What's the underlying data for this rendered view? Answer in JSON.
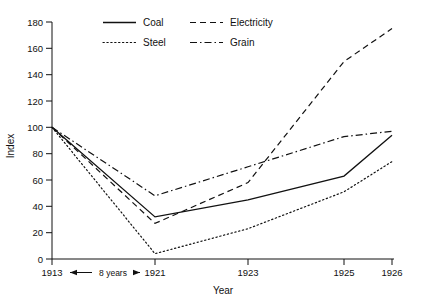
{
  "chart_data": {
    "type": "line",
    "title": "",
    "xlabel": "Year",
    "ylabel": "Index",
    "x": [
      "1913",
      "1921",
      "1923",
      "1925",
      "1926"
    ],
    "xtick_labels": [
      "1913",
      "1921",
      "1923",
      "1925",
      "1926"
    ],
    "ytick_labels": [
      "0",
      "20",
      "40",
      "60",
      "80",
      "100",
      "120",
      "140",
      "160",
      "180"
    ],
    "ylim": [
      0,
      180
    ],
    "ytick_step": 20,
    "grid": false,
    "legend_position": "top-center",
    "series": [
      {
        "name": "Coal",
        "style": "solid",
        "color": "#111111",
        "values": [
          100,
          32,
          45,
          63,
          94
        ]
      },
      {
        "name": "Electricity",
        "style": "dashed",
        "color": "#111111",
        "values": [
          100,
          27,
          58,
          150,
          175
        ]
      },
      {
        "name": "Steel",
        "style": "dotted",
        "color": "#111111",
        "values": [
          100,
          4,
          23,
          51,
          74
        ]
      },
      {
        "name": "Grain",
        "style": "dash-dot",
        "color": "#111111",
        "values": [
          100,
          48,
          70,
          93,
          97
        ]
      }
    ],
    "annotations": [
      {
        "text": "8 years",
        "between": [
          "1913",
          "1921"
        ],
        "type": "double-arrow-span"
      }
    ]
  },
  "legend": {
    "entries": [
      {
        "label": "Coal",
        "style": "solid"
      },
      {
        "label": "Electricity",
        "style": "dashed"
      },
      {
        "label": "Steel",
        "style": "dotted"
      },
      {
        "label": "Grain",
        "style": "dash-dot"
      }
    ]
  },
  "axes": {
    "y_title": "Index",
    "x_title": "Year"
  },
  "annotation": {
    "span_label": "8 years"
  }
}
